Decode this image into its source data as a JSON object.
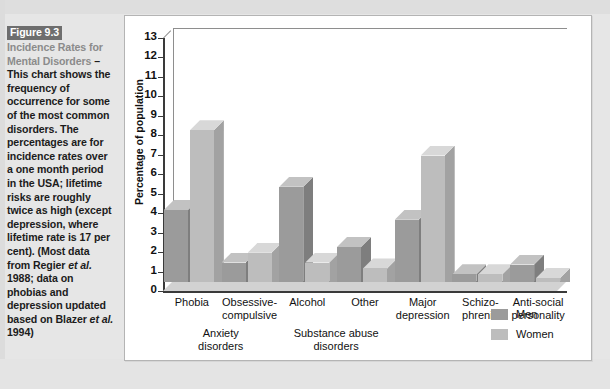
{
  "caption": {
    "figure_tag": "Figure 9.3",
    "gray_lead": "Incidence Rates for Mental Disorders",
    "dash": " – ",
    "body": "This chart shows the frequency of occurrence for some of the most common disorders. The percentages are for incidence rates over a one month period in the USA; lifetime risks are roughly twice as high (except depression, where lifetime rate is 17 per cent). (Most data from Regier ",
    "italic1": "et al.",
    "body2": " 1988; data on phobias and depression updated based on Blazer ",
    "italic2": "et al.",
    "body3": " 1994)"
  },
  "colors": {
    "men": "#9b9b9b",
    "men_top": "#c2c2c2",
    "men_side": "#7e7e7e",
    "women": "#bdbdbd",
    "women_top": "#d8d8d8",
    "women_side": "#a2a2a2",
    "axis": "#3a3a3a",
    "panel_bg": "#ffffff",
    "page_bg": "#e6e6e6",
    "tag_bg": "#6e6e6e"
  },
  "legend": {
    "position": "bottom-right",
    "items": [
      {
        "label": "Men",
        "color": "#9b9b9b"
      },
      {
        "label": "Women",
        "color": "#bdbdbd"
      }
    ]
  },
  "chart_data": {
    "type": "bar",
    "title": "",
    "xlabel": "",
    "ylabel": "Percentage of population",
    "ylim": [
      0,
      13
    ],
    "yticks": [
      0,
      1,
      2,
      3,
      4,
      5,
      6,
      7,
      8,
      9,
      10,
      11,
      12,
      13
    ],
    "grid": false,
    "three_d": true,
    "legend_position": "bottom-right",
    "categories": [
      "Phobia",
      "Obsessive-compulsive",
      "Alcohol",
      "Other",
      "Major depression",
      "Schizo-phrenia",
      "Anti-social personality"
    ],
    "category_lines": [
      [
        "Phobia"
      ],
      [
        "Obsessive-",
        "compulsive"
      ],
      [
        "Alcohol"
      ],
      [
        "Other"
      ],
      [
        "Major",
        "depression"
      ],
      [
        "Schizo-",
        "phrenia"
      ],
      [
        "Anti-social",
        "personality"
      ]
    ],
    "series": [
      {
        "name": "Men",
        "values": [
          3.7,
          1.0,
          4.9,
          1.8,
          3.2,
          0.4,
          0.9
        ]
      },
      {
        "name": "Women",
        "values": [
          7.8,
          1.5,
          1.0,
          0.7,
          6.5,
          0.4,
          0.2
        ]
      }
    ],
    "groups": [
      {
        "label_lines": [
          "Anxiety",
          "disorders"
        ],
        "categories": [
          "Phobia",
          "Obsessive-compulsive"
        ]
      },
      {
        "label_lines": [
          "Substance abuse",
          "disorders"
        ],
        "categories": [
          "Alcohol",
          "Other"
        ]
      }
    ]
  }
}
